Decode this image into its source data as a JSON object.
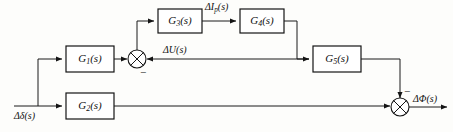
{
  "diagram": {
    "type": "signal-flow-block-diagram",
    "blocks": [
      {
        "id": "G1",
        "label": "G₁(s)",
        "base": "G",
        "sub": "1",
        "arg": "(s)",
        "x": 66,
        "y": 46,
        "w": 48,
        "h": 26
      },
      {
        "id": "G2",
        "label": "G₂(s)",
        "base": "G",
        "sub": "2",
        "arg": "(s)",
        "x": 66,
        "y": 93,
        "w": 48,
        "h": 26
      },
      {
        "id": "G3",
        "label": "G₃(s)",
        "base": "G",
        "sub": "3",
        "arg": "(s)",
        "x": 158,
        "y": 9,
        "w": 44,
        "h": 24
      },
      {
        "id": "G4",
        "label": "G₄(s)",
        "base": "G",
        "sub": "4",
        "arg": "(s)",
        "x": 240,
        "y": 9,
        "w": 44,
        "h": 24
      },
      {
        "id": "G5",
        "label": "G₅(s)",
        "base": "G",
        "sub": "5",
        "arg": "(s)",
        "x": 313,
        "y": 46,
        "w": 48,
        "h": 26
      }
    ],
    "junctions": [
      {
        "id": "sum1",
        "cx": 137,
        "cy": 59,
        "r": 9,
        "sign": "−",
        "sign_position": "bottom-right"
      },
      {
        "id": "sum2",
        "cx": 400,
        "cy": 107,
        "r": 9,
        "sign": "−",
        "sign_position": "top-right"
      }
    ],
    "signals": {
      "input": "Δδ(s)",
      "input_base": "Δδ",
      "input_arg": "(s)",
      "mid_u": "ΔU(s)",
      "mid_u_base": "ΔU",
      "mid_u_arg": "(s)",
      "mid_ip": "ΔIₚ(s)",
      "mid_ip_base": "ΔI",
      "mid_ip_sub": "p",
      "mid_ip_arg": "(s)",
      "output": "ΔΦ(s)",
      "output_base": "ΔΦ",
      "output_arg": "(s)"
    },
    "signs": {
      "sum1_minus": "−",
      "sum2_minus": "−"
    },
    "colors": {
      "line": "#141414",
      "block_fill": "#ffffff",
      "background": "#fdfdfb",
      "text": "#111111"
    }
  }
}
